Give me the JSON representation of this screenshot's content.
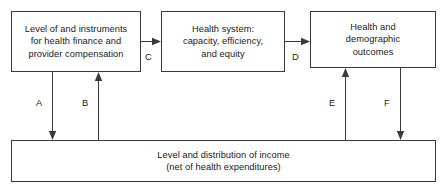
{
  "diagram": {
    "nodes": [
      {
        "id": "finance",
        "label": "Level of and instruments\nfor health finance and\nprovider compensation"
      },
      {
        "id": "system",
        "label": "Health system:\ncapacity, efficiency,\nand equity"
      },
      {
        "id": "outcome",
        "label": "Health and\ndemographic\noutcomes"
      },
      {
        "id": "income",
        "label": "Level and distribution of income\n(net of health expenditures)"
      }
    ],
    "edges": [
      {
        "id": "a",
        "label": "A",
        "from": "finance",
        "to": "income",
        "direction": "down"
      },
      {
        "id": "b",
        "label": "B",
        "from": "income",
        "to": "finance",
        "direction": "up"
      },
      {
        "id": "c",
        "label": "C",
        "from": "finance",
        "to": "system",
        "direction": "right"
      },
      {
        "id": "d",
        "label": "D",
        "from": "system",
        "to": "outcome",
        "direction": "right"
      },
      {
        "id": "e",
        "label": "E",
        "from": "income",
        "to": "outcome",
        "direction": "up"
      },
      {
        "id": "f",
        "label": "F",
        "from": "outcome",
        "to": "income",
        "direction": "down"
      }
    ],
    "colors": {
      "stroke": "#3a3a3a",
      "text": "#1a1a1a",
      "background": "#ffffff"
    }
  }
}
